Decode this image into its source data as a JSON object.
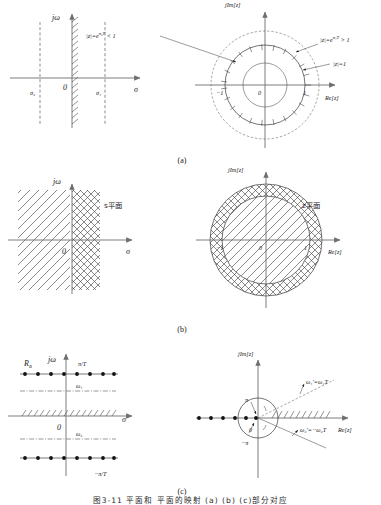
{
  "figure": {
    "domain": "signal-processing-s-to-z-plane-mapping",
    "panel_captions": {
      "a": "(a)",
      "b": "(b)",
      "c": "(c)"
    },
    "bottom_caption": "图3-11  平面和  平面的映射  (a)  (b)  (c)部分对应"
  },
  "panel_a": {
    "left": {
      "plane": "s-plane",
      "axis_vertical_label": "jω",
      "axis_horizontal_label": "σ",
      "origin_label": "0",
      "line_left_label": "σ₂",
      "line_right_label": "σ₁",
      "hatched_axis": "jω-axis"
    },
    "right": {
      "plane": "z-plane",
      "axis_vertical_label": "jIm[z]",
      "axis_horizontal_label": "Re[z]",
      "origin_label": "0",
      "tick_left": "−1",
      "tick_right": "1",
      "label_inner": "|z|=e",
      "label_inner_sup": "σ₂T",
      "label_inner_tail": " < 1",
      "label_outer": "|z|=e",
      "label_outer_sup": "σ₁T",
      "label_outer_tail": " > 1",
      "label_unit": "|z|=1"
    }
  },
  "panel_b": {
    "left": {
      "plane_label": "s平面",
      "axis_vertical_label": "jω",
      "axis_horizontal_label": "σ",
      "origin_label": "0"
    },
    "right": {
      "plane_label": "z平面",
      "axis_vertical_label": "jIm[z]",
      "axis_horizontal_label": "Re[z]",
      "origin_label": "0",
      "tick_left": "−1",
      "tick_right": "1"
    }
  },
  "panel_c": {
    "left": {
      "plane": "s-plane",
      "axis_vertical_label": "jω",
      "axis_horizontal_label": "σ",
      "origin_label": "0",
      "region_label": "R",
      "region_label_sub": "B",
      "top_line_label": "π/T",
      "bottom_line_label": "−π/T",
      "omega1_label": "ω₁",
      "omega2_label": "ω₂",
      "poles_top_count": 8,
      "poles_bottom_count": 8
    },
    "right": {
      "plane": "z-plane",
      "axis_vertical_label": "jIm[z]",
      "axis_horizontal_label": "Re[z]",
      "origin_label": "0",
      "angle_top_label": "π",
      "angle_bottom_label": "−π",
      "omega1_prime": "ω₁'=ω₁T",
      "omega2_prime": "ω₂'=−ω₂T",
      "poles_count": 6
    }
  }
}
